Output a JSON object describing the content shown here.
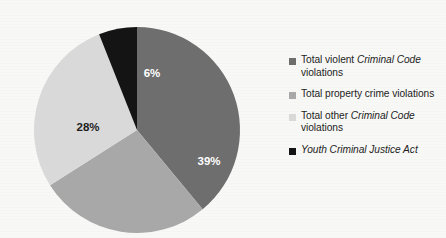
{
  "chart_data": {
    "type": "pie",
    "title": "",
    "subtitle": "",
    "legend_position": "right",
    "start_angle_deg": 0,
    "direction": "clockwise",
    "categories": [
      "Total violent Criminal Code violations",
      "Total property crime violations",
      "Total other Criminal Code violations",
      "Youth Criminal Justice Act"
    ],
    "values": [
      39,
      27,
      28,
      6
    ],
    "value_unit": "%",
    "slices": [
      {
        "label": "39%",
        "value": 39,
        "color": "#6e6e6e",
        "label_color": "#ffffff",
        "label_x": 175,
        "label_y": 135,
        "category": "Total violent Criminal Code violations"
      },
      {
        "label": "27%",
        "value": 27,
        "color": "#a8a8a8",
        "label_color": "#ffffff",
        "label_x": 122,
        "label_y": 216,
        "category": "Total property crime violations"
      },
      {
        "label": "28%",
        "value": 28,
        "color": "#d9d9d9",
        "label_color": "#1d1d1d",
        "label_x": 54,
        "label_y": 101,
        "category": "Total other Criminal Code violations"
      },
      {
        "label": "6%",
        "value": 6,
        "color": "#141414",
        "label_color": "#ffffff",
        "label_x": 118,
        "label_y": 47,
        "category": "Youth Criminal Justice Act"
      }
    ],
    "geometry": {
      "center_x": 103,
      "center_y": 103,
      "radius": 103
    }
  },
  "legend": {
    "items": [
      {
        "color": "#6e6e6e",
        "text_runs": [
          {
            "text": "Total violent ",
            "italic": false
          },
          {
            "text": "Criminal Code",
            "italic": true
          },
          {
            "text": " violations",
            "italic": false
          }
        ]
      },
      {
        "color": "#a8a8a8",
        "text_runs": [
          {
            "text": "Total property crime violations",
            "italic": false
          }
        ]
      },
      {
        "color": "#d9d9d9",
        "text_runs": [
          {
            "text": "Total other ",
            "italic": false
          },
          {
            "text": "Criminal Code",
            "italic": true
          },
          {
            "text": " violations",
            "italic": false
          }
        ]
      },
      {
        "color": "#141414",
        "text_runs": [
          {
            "text": "Youth Criminal Justice Act",
            "italic": true
          }
        ]
      }
    ]
  },
  "colors": {
    "background": "#f8f8f6",
    "slice_violent": "#6e6e6e",
    "slice_property": "#a8a8a8",
    "slice_other": "#d9d9d9",
    "slice_youth": "#141414",
    "text": "#1d1d1d",
    "label_light": "#ffffff"
  }
}
